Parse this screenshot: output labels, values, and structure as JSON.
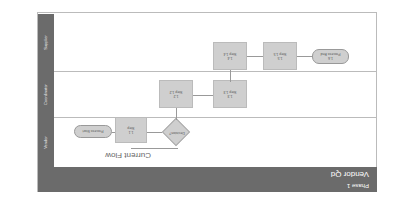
{
  "diagram": {
    "title": "Vendor Qd",
    "subtitle": "Phase 1",
    "caption": "Current Flow",
    "orientation": "rotated 180 degrees",
    "lanes": [
      {
        "label": "Vendor"
      },
      {
        "label": "Coordinator"
      },
      {
        "label": "Supplier"
      }
    ],
    "nodes": {
      "start": {
        "label": "Process Start"
      },
      "step_1_1": {
        "id": "1.1",
        "label": "Step"
      },
      "decision": {
        "label": "Decision?"
      },
      "loop_label": "No",
      "step_1_2": {
        "id": "1.2",
        "label": "Step 1.2"
      },
      "step_1_3": {
        "id": "1.3",
        "label": "Step 1.3"
      },
      "step_1_4": {
        "id": "1.4",
        "label": "Step 1.4"
      },
      "step_1_5": {
        "id": "1.5",
        "label": "Step 1.5"
      },
      "end": {
        "id": "1.6",
        "label": "Process End"
      }
    }
  }
}
